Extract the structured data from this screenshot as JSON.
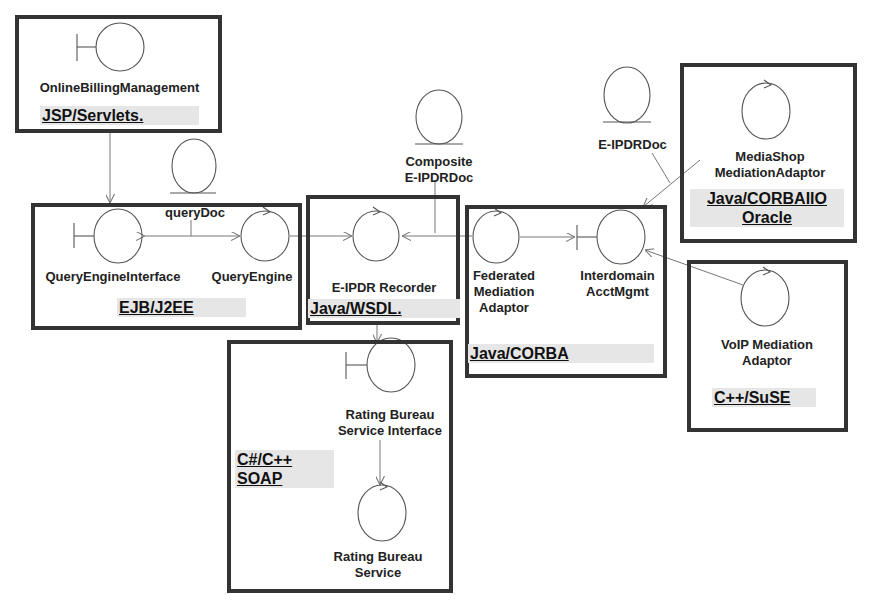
{
  "diagram": {
    "type": "UML robustness / component deployment diagram",
    "components": [
      {
        "id": "obm",
        "label": "OnlineBillingManagement",
        "tech": "JSP/Servlets.",
        "stereotype": "boundary"
      },
      {
        "id": "qei",
        "label": "QueryEngineInterface",
        "stereotype": "boundary"
      },
      {
        "id": "qe",
        "label": "QueryEngine",
        "stereotype": "control"
      },
      {
        "id": "ejb_tech",
        "tech": "EJB/J2EE"
      },
      {
        "id": "rec",
        "label": "E-IPDR Recorder",
        "tech": "Java/WSDL.",
        "stereotype": "control"
      },
      {
        "id": "fma",
        "label": "Federated Mediation Adaptor",
        "stereotype": "control"
      },
      {
        "id": "iam",
        "label": "Interdomain AcctMgmt",
        "stereotype": "boundary"
      },
      {
        "id": "corba_tech",
        "tech": "Java/CORBA"
      },
      {
        "id": "msma",
        "label": "MediaShop MediationAdaptor",
        "tech": "Java/CORBAIIO Oracle",
        "stereotype": "control"
      },
      {
        "id": "voip",
        "label": "VoIP Mediation Adaptor",
        "tech": "C++/SuSE",
        "stereotype": "control"
      },
      {
        "id": "rbsi",
        "label": "Rating Bureau Service Interface",
        "stereotype": "boundary"
      },
      {
        "id": "rbs",
        "label": "Rating Bureau Service",
        "stereotype": "control"
      },
      {
        "id": "rating_tech",
        "tech": "C#/C++ SOAP"
      }
    ],
    "entities": [
      {
        "id": "querydoc",
        "label": "queryDoc"
      },
      {
        "id": "composite",
        "label": "Composite E-IPDRDoc"
      },
      {
        "id": "eipdrdoc",
        "label": "E-IPDRDoc"
      }
    ],
    "labels": {
      "obm": "OnlineBillingManagement",
      "obm_tech": "JSP/Servlets.",
      "querydoc": "queryDoc",
      "qei": "QueryEngineInterface",
      "qe": "QueryEngine",
      "ejb_tech": "EJB/J2EE",
      "composite_1": "Composite",
      "composite_2": "E-IPDRDoc",
      "rec": "E-IPDR Recorder",
      "rec_tech": "Java/WSDL.",
      "eipdrdoc": "E-IPDRDoc",
      "fma_1": "Federated",
      "fma_2": "Mediation",
      "fma_3": "Adaptor",
      "iam_1": "Interdomain",
      "iam_2": "AcctMgmt",
      "corba_tech": "Java/CORBA",
      "msma_1": "MediaShop",
      "msma_2": "MediationAdaptor",
      "msma_tech_1": "Java/CORBAIIO",
      "msma_tech_2": "Oracle",
      "voip_1": "VoIP Mediation",
      "voip_2": "Adaptor",
      "voip_tech": "C++/SuSE",
      "rbsi_1": "Rating Bureau",
      "rbsi_2": "Service Interface",
      "rating_tech_1": "C#/C++",
      "rating_tech_2": "SOAP",
      "rbs_1": "Rating Bureau",
      "rbs_2": "Service"
    },
    "connections": [
      {
        "from": "obm",
        "to": "qei"
      },
      {
        "from": "qei",
        "to": "qe",
        "bidirectional": true,
        "via": "querydoc"
      },
      {
        "from": "qe",
        "to": "rec"
      },
      {
        "from": "fma",
        "to": "rec",
        "via": "composite"
      },
      {
        "from": "fma",
        "to": "iam"
      },
      {
        "from": "msma",
        "to": "iam",
        "via": "eipdrdoc"
      },
      {
        "from": "voip",
        "to": "iam"
      },
      {
        "from": "rec",
        "to": "rbsi"
      },
      {
        "from": "rbsi",
        "to": "rbs"
      }
    ],
    "colors": {
      "box_border": "#333333",
      "line": "#777777",
      "tech_bg": "#e6e6e6",
      "text": "#222222"
    }
  }
}
